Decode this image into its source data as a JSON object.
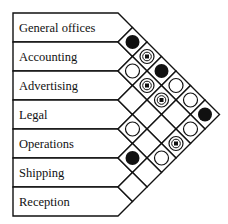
{
  "departments": [
    "General offices",
    "Accounting",
    "Advertising",
    "Legal",
    "Operations",
    "Shipping",
    "Reception"
  ],
  "symbol_legend": {
    "filled": "filled-circle",
    "dot": "circle-with-square-dot",
    "empty": "open-circle",
    "none": "blank"
  },
  "relationships": [
    {
      "a": 0,
      "b": 1,
      "symbol": "filled"
    },
    {
      "a": 0,
      "b": 2,
      "symbol": "dot"
    },
    {
      "a": 0,
      "b": 3,
      "symbol": "filled"
    },
    {
      "a": 0,
      "b": 4,
      "symbol": "empty"
    },
    {
      "a": 0,
      "b": 5,
      "symbol": "empty"
    },
    {
      "a": 0,
      "b": 6,
      "symbol": "filled"
    },
    {
      "a": 1,
      "b": 2,
      "symbol": "empty"
    },
    {
      "a": 1,
      "b": 3,
      "symbol": "dot"
    },
    {
      "a": 1,
      "b": 4,
      "symbol": "dot"
    },
    {
      "a": 1,
      "b": 5,
      "symbol": "none"
    },
    {
      "a": 1,
      "b": 6,
      "symbol": "empty"
    },
    {
      "a": 2,
      "b": 3,
      "symbol": "none"
    },
    {
      "a": 2,
      "b": 4,
      "symbol": "none"
    },
    {
      "a": 2,
      "b": 5,
      "symbol": "none"
    },
    {
      "a": 2,
      "b": 6,
      "symbol": "dot"
    },
    {
      "a": 3,
      "b": 4,
      "symbol": "empty"
    },
    {
      "a": 3,
      "b": 5,
      "symbol": "none"
    },
    {
      "a": 3,
      "b": 6,
      "symbol": "empty"
    },
    {
      "a": 4,
      "b": 5,
      "symbol": "filled"
    },
    {
      "a": 4,
      "b": 6,
      "symbol": "none"
    },
    {
      "a": 5,
      "b": 6,
      "symbol": "none"
    }
  ],
  "colors": {
    "ink": "#111111",
    "background": "#ffffff"
  }
}
